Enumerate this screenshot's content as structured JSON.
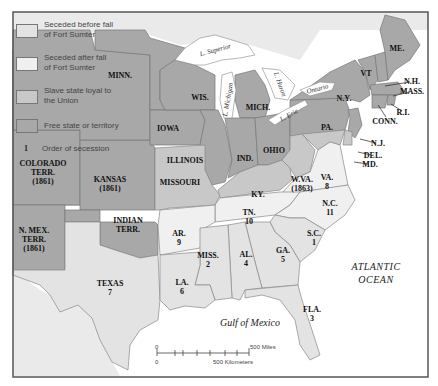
{
  "legend": {
    "items": [
      {
        "key": "before",
        "label_line1": "Seceded before fall",
        "label_line2": "of Fort Sumter",
        "color": "#e3e3e3"
      },
      {
        "key": "after",
        "label_line1": "Seceded after fall",
        "label_line2": "of Fort Sumter",
        "color": "#f0f0f0"
      },
      {
        "key": "slaveloyal",
        "label_line1": "Slave state loyal to",
        "label_line2": "the Union",
        "color": "#c8c8c8"
      },
      {
        "key": "free",
        "label_line1": "Free state or territory",
        "label_line2": "",
        "color": "#a8a8a8"
      }
    ],
    "order_symbol": "1",
    "order_label": "Order of secession"
  },
  "states": {
    "minn": {
      "name": "MINN."
    },
    "wis": {
      "name": "WIS."
    },
    "mich": {
      "name": "MICH."
    },
    "iowa": {
      "name": "IOWA"
    },
    "illinois": {
      "name": "ILLINOIS"
    },
    "ind": {
      "name": "IND."
    },
    "ohio": {
      "name": "OHIO"
    },
    "pa": {
      "name": "PA."
    },
    "ny": {
      "name": "N.Y."
    },
    "vt": {
      "name": "VT"
    },
    "me": {
      "name": "ME."
    },
    "nh": {
      "name": "N.H."
    },
    "mass": {
      "name": "MASS."
    },
    "ri": {
      "name": "R.I."
    },
    "conn": {
      "name": "CONN."
    },
    "nj": {
      "name": "N.J."
    },
    "del": {
      "name": "DEL."
    },
    "md": {
      "name": "MD."
    },
    "wva": {
      "name": "W.VA.",
      "year": "(1863)"
    },
    "va": {
      "name": "VA.",
      "order": "8"
    },
    "nc": {
      "name": "N.C.",
      "order": "11"
    },
    "sc": {
      "name": "S.C.",
      "order": "1"
    },
    "ga": {
      "name": "GA.",
      "order": "5"
    },
    "fla": {
      "name": "FLA.",
      "order": "3"
    },
    "al": {
      "name": "AL.",
      "order": "4"
    },
    "miss": {
      "name": "MISS.",
      "order": "2"
    },
    "la": {
      "name": "LA.",
      "order": "6"
    },
    "tx": {
      "name": "TEXAS",
      "order": "7"
    },
    "ar": {
      "name": "AR.",
      "order": "9"
    },
    "tn": {
      "name": "TN.",
      "order": "10"
    },
    "ky": {
      "name": "KY."
    },
    "missouri": {
      "name": "MISSOURI"
    },
    "kansas": {
      "name": "KANSAS",
      "year": "(1861)"
    },
    "indian": {
      "name": "INDIAN",
      "line2": "TERR."
    },
    "colorado": {
      "name": "COLORADO",
      "line2": "TERR.",
      "year": "(1861)"
    },
    "nmex": {
      "name": "N. MEX.",
      "line2": "TERR.",
      "year": "(1861)"
    }
  },
  "water": {
    "superior": "L. Superior",
    "michigan": "L. Michigan",
    "huron": "L. Huron",
    "erie": "L. Erie",
    "ontario": "Ontario",
    "atlantic_line1": "ATLANTIC",
    "atlantic_line2": "OCEAN",
    "gulf": "Gulf of Mexico"
  },
  "scale": {
    "zero_top": "0",
    "zero_bottom": "0",
    "miles": "500 Miles",
    "km": "500 Kilometers"
  }
}
